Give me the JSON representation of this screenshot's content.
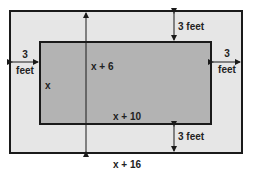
{
  "diagram": {
    "colors": {
      "outer_fill": "#e6e6e6",
      "inner_fill": "#b3b3b3",
      "stroke": "#1a1a1a"
    },
    "labels": {
      "top_margin": "3 feet",
      "bottom_margin": "3 feet",
      "left_margin_value": "3",
      "left_margin_unit": "feet",
      "right_margin_value": "3",
      "right_margin_unit": "feet",
      "inner_height": "x",
      "outer_height": "x + 6",
      "inner_width": "x + 10",
      "outer_width": "x + 16"
    }
  }
}
